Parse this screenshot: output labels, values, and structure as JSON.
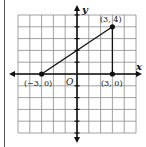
{
  "figure": {
    "type": "coordinate-plane",
    "grid": {
      "xmin": -5,
      "xmax": 5,
      "ymin": -5,
      "ymax": 5,
      "step": 1
    },
    "axes": {
      "x_label": "x",
      "y_label": "y",
      "origin_label": "O"
    },
    "points": [
      {
        "name": "A",
        "x": -3,
        "y": 0,
        "label": "(−3, 0)"
      },
      {
        "name": "B",
        "x": 3,
        "y": 4,
        "label": "(3, 4)"
      },
      {
        "name": "C",
        "x": 3,
        "y": 0,
        "label": "(3, 0)"
      }
    ],
    "segments": [
      {
        "from": "A",
        "to": "B"
      },
      {
        "from": "B",
        "to": "C"
      },
      {
        "from": "C",
        "to": "A"
      }
    ],
    "colors": {
      "grid": "#8a8a8a",
      "axis": "#111111",
      "line": "#111111",
      "border": "#555555"
    }
  }
}
